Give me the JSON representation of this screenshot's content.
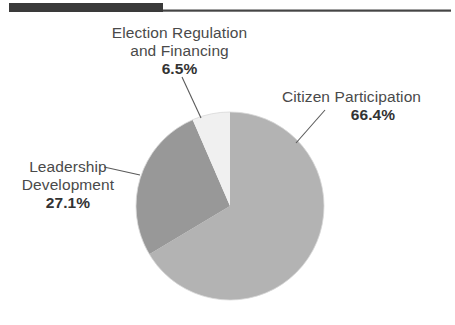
{
  "page": {
    "background_color": "#ffffff",
    "width": 455,
    "height": 325
  },
  "header": {
    "rule_color": "#3a3a3a",
    "hairline_color": "#454545"
  },
  "chart_data": {
    "type": "pie",
    "title": "",
    "subtitle": "",
    "xlabel": "",
    "ylabel": "",
    "legend_position": "callout-labels",
    "grid": false,
    "units": "percent",
    "start_angle_deg": 0,
    "direction": "clockwise",
    "center": {
      "x": 230,
      "y": 206
    },
    "radius": 94,
    "categories": [
      "Citizen Participation",
      "Leadership Development",
      "Election Regulation and Financing"
    ],
    "values": [
      66.4,
      27.1,
      6.5
    ],
    "value_labels": [
      "66.4%",
      "27.1%",
      "6.5%"
    ],
    "colors": [
      "#b3b3b3",
      "#989898",
      "#f0f0f0"
    ],
    "slices": [
      {
        "name": "Citizen Participation",
        "value": 66.4,
        "value_label": "66.4%",
        "color": "#b3b3b3",
        "label_line1": "Citizen Participation",
        "label_line2": "",
        "leader_line": true
      },
      {
        "name": "Leadership Development",
        "value": 27.1,
        "value_label": "27.1%",
        "color": "#989898",
        "label_line1": "Leadership",
        "label_line2": "Development",
        "leader_line": true
      },
      {
        "name": "Election Regulation and Financing",
        "value": 6.5,
        "value_label": "6.5%",
        "color": "#f0f0f0",
        "label_line1": "Election Regulation",
        "label_line2": "and Financing",
        "leader_line": true
      }
    ]
  },
  "labels": {
    "election": {
      "line1": "Election Regulation",
      "line2": "and Financing",
      "percent": "6.5%"
    },
    "citizen": {
      "line1": "Citizen Participation",
      "percent": "66.4%"
    },
    "leadership": {
      "line1": "Leadership",
      "line2": "Development",
      "percent": "27.1%"
    }
  }
}
